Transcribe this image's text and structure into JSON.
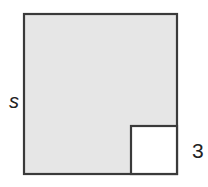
{
  "diagram": {
    "outer_square": {
      "label": "s",
      "fill": "#e6e6e6",
      "stroke": "#3a3a3a"
    },
    "inner_square": {
      "label": "3",
      "fill": "#ffffff",
      "stroke": "#3a3a3a"
    }
  }
}
